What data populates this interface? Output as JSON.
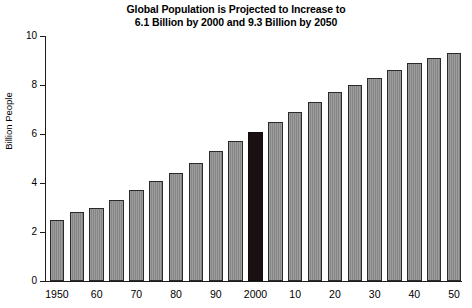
{
  "chart_data": {
    "type": "bar",
    "title": "Global Population is Projected to Increase to\n6.1 Billion by 2000 and 9.3 Billion by 2050",
    "xlabel": "",
    "ylabel": "Billion People",
    "ylim": [
      0,
      10
    ],
    "yticks": [
      0,
      2,
      4,
      6,
      8,
      10
    ],
    "ytick_labels": [
      "0",
      "2",
      "4",
      "6",
      "8",
      "10"
    ],
    "grid": false,
    "legend": null,
    "bar_color": "#8e8e8e",
    "highlight_color": "#1a1012",
    "highlight_category": "2000",
    "categories": [
      "1950",
      "1955",
      "1960",
      "1965",
      "1970",
      "1975",
      "1980",
      "1985",
      "1990",
      "1995",
      "2000",
      "2005",
      "2010",
      "2015",
      "2020",
      "2025",
      "2030",
      "2035",
      "2040",
      "2045",
      "2050"
    ],
    "tick_labels": [
      "1950",
      "",
      "60",
      "",
      "70",
      "",
      "80",
      "",
      "90",
      "",
      "2000",
      "",
      "10",
      "",
      "20",
      "",
      "30",
      "",
      "40",
      "",
      "50"
    ],
    "values": [
      2.5,
      2.8,
      3.0,
      3.3,
      3.7,
      4.1,
      4.4,
      4.8,
      5.3,
      5.7,
      6.1,
      6.5,
      6.9,
      7.3,
      7.7,
      8.0,
      8.3,
      8.6,
      8.9,
      9.1,
      9.3
    ],
    "annotations": [
      "6.1 Billion by 2000",
      "9.3 Billion by 2050"
    ]
  }
}
